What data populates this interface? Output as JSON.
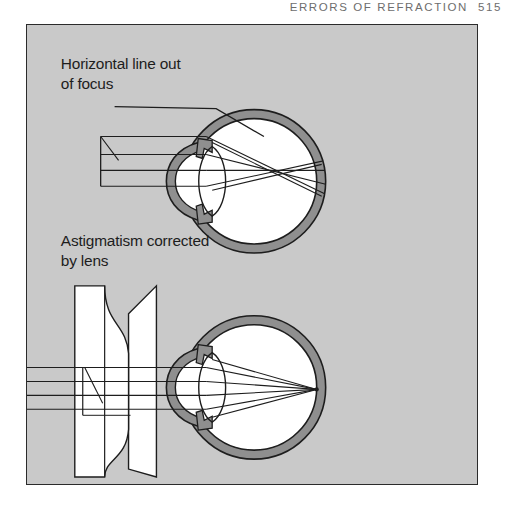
{
  "running_head": {
    "title": "ERRORS OF REFRACTION",
    "page_number": "515"
  },
  "figure": {
    "background_color": "#c9c9c9",
    "border_color": "#2b2b2b",
    "ink_color": "#1d1d1d",
    "sclera_color": "#8f8f8f",
    "interior_color": "#ffffff",
    "labels": [
      {
        "id": "uncorrected",
        "line1": "Horizontal line out",
        "line2": "of focus",
        "has_leader_line": true
      },
      {
        "id": "corrected",
        "line1": "Astigmatism corrected",
        "line2": "by lens",
        "has_leader_line": false
      }
    ],
    "diagrams": [
      {
        "id": "eye-uncorrected",
        "caption_ref": "Horizontal line out of focus",
        "corrective_lens": false,
        "focus": "blurred",
        "ray_count": 4
      },
      {
        "id": "eye-corrected",
        "caption_ref": "Astigmatism corrected by lens",
        "corrective_lens": true,
        "corrective_lens_type": "cylindrical-concave",
        "focus": "point",
        "ray_count": 4
      }
    ]
  }
}
